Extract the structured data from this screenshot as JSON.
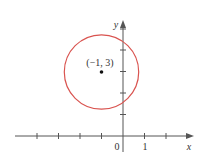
{
  "figure": {
    "type": "coordinate-plane-circle",
    "axes": {
      "x_label": "x",
      "y_label": "y",
      "origin_label": "0",
      "x_unit_label": "1",
      "x_ticks": [
        -4,
        -3,
        -2,
        -1,
        1,
        2
      ],
      "y_ticks": [
        1,
        2,
        3,
        4,
        5
      ]
    },
    "circle": {
      "center": [
        -1,
        3
      ],
      "center_label": "(−1, 3)",
      "radius": 1.732,
      "color": "#d9534f"
    },
    "colors": {
      "axis": "#555555",
      "text": "#333333",
      "point": "#111111"
    }
  }
}
